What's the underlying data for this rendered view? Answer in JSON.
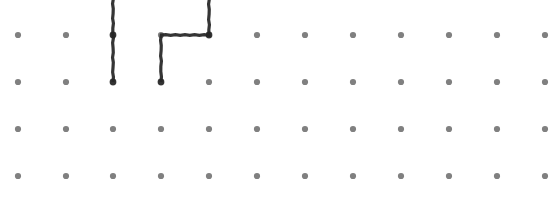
{
  "canvas": {
    "width": 559,
    "height": 218,
    "background_color": "#ffffff",
    "name": "dot-grid-drawing-canvas"
  },
  "grid": {
    "dot_color": "#808080",
    "dot_radius": 3.1,
    "columns_x": [
      18,
      66,
      113,
      161,
      209,
      257,
      305,
      353,
      401,
      449,
      497,
      545
    ],
    "rows_y": [
      35,
      82,
      129,
      176,
      223
    ],
    "column_spacing": 47.9,
    "row_spacing": 47,
    "column_count": 12,
    "row_count": 5,
    "visible_row_count": 4,
    "clipped_bottom_row": true,
    "clipped_row_opacity": 0.12
  },
  "ink": {
    "stroke_color": "#262626",
    "stroke_width": 3.2,
    "opacity": 0.93,
    "strokes": [
      {
        "id": "stroke-1",
        "label": "vertical-line-column-3",
        "points": [
          [
            113,
            -6
          ],
          [
            113,
            82
          ]
        ]
      },
      {
        "id": "stroke-2",
        "label": "hook-path-column-5-to-column-4",
        "points": [
          [
            209,
            -6
          ],
          [
            209,
            35
          ],
          [
            161,
            35
          ],
          [
            161,
            82
          ]
        ]
      }
    ]
  },
  "endpoints": [
    {
      "label": "endpoint-stroke-1",
      "x": 113,
      "y": 82
    },
    {
      "label": "endpoint-stroke-2",
      "x": 161,
      "y": 82
    },
    {
      "label": "junction-stroke-1",
      "x": 113,
      "y": 35
    },
    {
      "label": "corner-stroke-2",
      "x": 209,
      "y": 35
    }
  ]
}
